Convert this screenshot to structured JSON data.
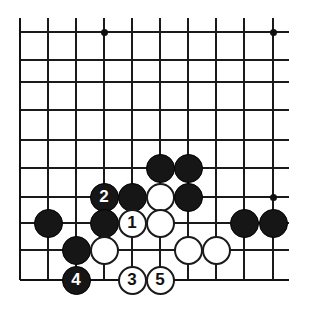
{
  "figure": {
    "kind": "go-board-diagram",
    "title": "",
    "board_size_shown": {
      "columns": 10,
      "rows": 10
    },
    "colors": {
      "background": "#ffffff",
      "line": "#1a1a1a",
      "black_stone": "#161616",
      "white_stone": "#ffffff",
      "black_stone_label": "#ffffff",
      "white_stone_label": "#111111"
    },
    "geometry": {
      "col_x": [
        20,
        48,
        76,
        104,
        132,
        160,
        188,
        216,
        244,
        273
      ],
      "row_y": [
        32,
        60,
        82,
        110,
        140,
        168,
        197,
        223,
        250,
        280
      ],
      "stone_diameter": 29,
      "left_edge_is_board_edge": true,
      "bottom_edge_is_board_edge": true
    },
    "star_points": [
      {
        "col": 3,
        "row": 0
      },
      {
        "col": 9,
        "row": 0
      },
      {
        "col": 9,
        "row": 6
      }
    ],
    "stones": [
      {
        "color": "black",
        "col": 5,
        "row": 5,
        "label": ""
      },
      {
        "color": "black",
        "col": 6,
        "row": 5,
        "label": ""
      },
      {
        "color": "black",
        "col": 3,
        "row": 6,
        "label": "2"
      },
      {
        "color": "black",
        "col": 4,
        "row": 6,
        "label": ""
      },
      {
        "color": "white",
        "col": 5,
        "row": 6,
        "label": ""
      },
      {
        "color": "black",
        "col": 6,
        "row": 6,
        "label": ""
      },
      {
        "color": "black",
        "col": 1,
        "row": 7,
        "label": ""
      },
      {
        "color": "black",
        "col": 3,
        "row": 7,
        "label": ""
      },
      {
        "color": "white",
        "col": 4,
        "row": 7,
        "label": "1"
      },
      {
        "color": "white",
        "col": 5,
        "row": 7,
        "label": ""
      },
      {
        "color": "black",
        "col": 8,
        "row": 7,
        "label": ""
      },
      {
        "color": "black",
        "col": 9,
        "row": 7,
        "label": ""
      },
      {
        "color": "black",
        "col": 2,
        "row": 8,
        "label": ""
      },
      {
        "color": "white",
        "col": 3,
        "row": 8,
        "label": ""
      },
      {
        "color": "white",
        "col": 6,
        "row": 8,
        "label": ""
      },
      {
        "color": "white",
        "col": 7,
        "row": 8,
        "label": ""
      },
      {
        "color": "black",
        "col": 2,
        "row": 9,
        "label": "4"
      },
      {
        "color": "white",
        "col": 4,
        "row": 9,
        "label": "3"
      },
      {
        "color": "white",
        "col": 5,
        "row": 9,
        "label": "5"
      }
    ],
    "move_sequence": [
      {
        "number": "1",
        "color": "white",
        "col": 4,
        "row": 7
      },
      {
        "number": "2",
        "color": "black",
        "col": 3,
        "row": 6
      },
      {
        "number": "3",
        "color": "white",
        "col": 4,
        "row": 9
      },
      {
        "number": "4",
        "color": "black",
        "col": 2,
        "row": 9
      },
      {
        "number": "5",
        "color": "white",
        "col": 5,
        "row": 9
      }
    ]
  }
}
